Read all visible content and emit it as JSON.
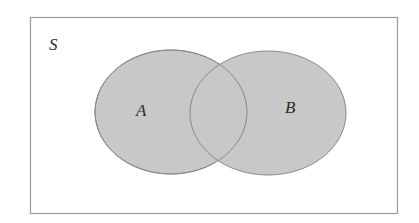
{
  "diagram": {
    "type": "venn",
    "universe_label": "S",
    "sets": [
      {
        "name": "A",
        "label": "A"
      },
      {
        "name": "B",
        "label": "B"
      }
    ],
    "shaded_regions": [
      "A only",
      "A∩B",
      "B only"
    ],
    "colors": {
      "fill": "#c8c8c8",
      "stroke": "#8a8a8a",
      "frame": "#9a9a9a",
      "background": "#ffffff"
    }
  }
}
